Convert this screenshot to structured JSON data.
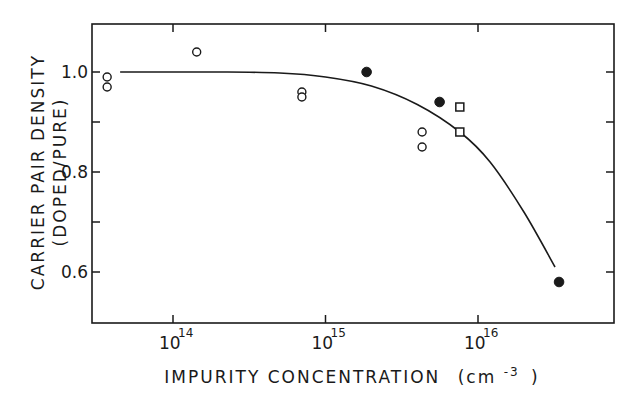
{
  "chart_data": {
    "type": "scatter",
    "title": "",
    "xlabel": "IMPURITY CONCENTRATION (cm-3)",
    "xlabel_main": "IMPURITY CONCENTRATION",
    "xlabel_unit_base": "(cm",
    "xlabel_unit_exp": "-3",
    "xlabel_unit_close": ")",
    "ylabel_line1": "CARRIER PAIR DENSITY",
    "ylabel_line2": "(DOPED/PURE)",
    "ylabel": "CARRIER PAIR DENSITY (DOPED/PURE)",
    "xscale": "log",
    "xlim": [
      20000000000000.0,
      6e+16
    ],
    "ylim": [
      0.53,
      1.1
    ],
    "x_ticks": [
      {
        "value": 100000000000000.0,
        "base": "10",
        "exp": "14"
      },
      {
        "value": 1000000000000000.0,
        "base": "10",
        "exp": "15"
      },
      {
        "value": 1e+16,
        "base": "10",
        "exp": "16"
      }
    ],
    "y_ticks": [
      {
        "value": 1.0,
        "label": "1.0"
      },
      {
        "value": 0.9,
        "label": ""
      },
      {
        "value": 0.8,
        "label": "0.8"
      },
      {
        "value": 0.7,
        "label": ""
      },
      {
        "value": 0.6,
        "label": "0.6"
      }
    ],
    "grid": false,
    "legend": null,
    "series": [
      {
        "name": "open circles",
        "marker": "open-circle",
        "points": [
          {
            "x": 37000000000000.0,
            "y": 0.99
          },
          {
            "x": 37000000000000.0,
            "y": 0.97
          },
          {
            "x": 143000000000000.0,
            "y": 1.04
          },
          {
            "x": 700000000000000.0,
            "y": 0.96
          },
          {
            "x": 700000000000000.0,
            "y": 0.95
          },
          {
            "x": 4300000000000000.0,
            "y": 0.88
          },
          {
            "x": 4300000000000000.0,
            "y": 0.85
          }
        ]
      },
      {
        "name": "filled circles",
        "marker": "filled-circle",
        "points": [
          {
            "x": 1860000000000000.0,
            "y": 1.0
          },
          {
            "x": 5600000000000000.0,
            "y": 0.94
          },
          {
            "x": 3.4e+16,
            "y": 0.58
          }
        ]
      },
      {
        "name": "open squares",
        "marker": "open-square",
        "points": [
          {
            "x": 7600000000000000.0,
            "y": 0.93
          },
          {
            "x": 7600000000000000.0,
            "y": 0.88
          }
        ]
      }
    ],
    "fit_curve": {
      "name": "theoretical curve",
      "points": [
        {
          "x": 45000000000000.0,
          "y": 1.0
        },
        {
          "x": 200000000000000.0,
          "y": 1.0
        },
        {
          "x": 500000000000000.0,
          "y": 0.998
        },
        {
          "x": 1000000000000000.0,
          "y": 0.99
        },
        {
          "x": 2000000000000000.0,
          "y": 0.972
        },
        {
          "x": 4000000000000000.0,
          "y": 0.935
        },
        {
          "x": 7600000000000000.0,
          "y": 0.88
        },
        {
          "x": 1.2e+16,
          "y": 0.82
        },
        {
          "x": 2e+16,
          "y": 0.72
        },
        {
          "x": 3.2e+16,
          "y": 0.61
        }
      ]
    }
  },
  "colors": {
    "ink": "#1a1a1a",
    "background": "#ffffff"
  }
}
